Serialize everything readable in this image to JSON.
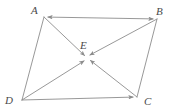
{
  "figure": {
    "background_color": "#ffffff",
    "stroke_color": "#8c8c8c",
    "label_color": "#4a4a4a",
    "stroke_width": 0.9,
    "labels": {
      "A": "A",
      "B": "B",
      "C": "C",
      "D": "D",
      "E": "E"
    },
    "points": {
      "A": {
        "x": 44,
        "y": 17
      },
      "B": {
        "x": 157,
        "y": 19
      },
      "C": {
        "x": 137,
        "y": 97
      },
      "D": {
        "x": 22,
        "y": 100
      },
      "E": {
        "x": 87,
        "y": 58
      }
    },
    "segments": [
      {
        "name": "side-AB",
        "from": "A",
        "to": "B",
        "arrow_at": "both"
      },
      {
        "name": "side-BC",
        "from": "B",
        "to": "C",
        "arrow_at": "none"
      },
      {
        "name": "side-DC",
        "from": "D",
        "to": "C",
        "arrow_at": "to"
      },
      {
        "name": "side-AD",
        "from": "A",
        "to": "D",
        "arrow_at": "none"
      },
      {
        "name": "diagonal-AC-lower",
        "from": "A",
        "to": "E",
        "arrow_at": "to"
      },
      {
        "name": "diagonal-AC-upper",
        "from": "C",
        "to": "E",
        "arrow_at": "to"
      },
      {
        "name": "diagonal-BD-lower",
        "from": "B",
        "to": "E",
        "arrow_at": "to"
      },
      {
        "name": "diagonal-BD-upper",
        "from": "D",
        "to": "E",
        "arrow_at": "to"
      }
    ]
  }
}
